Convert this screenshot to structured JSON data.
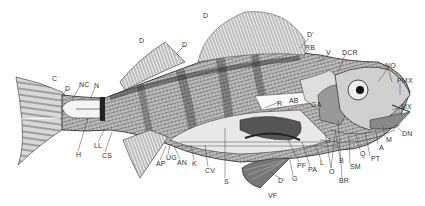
{
  "figure": {
    "caption_visible": "",
    "colors": {
      "ink": "#2a2a2a",
      "shade": "#555555",
      "paper": "#ffffff",
      "light": "#cfcfcf"
    }
  },
  "labels": [
    {
      "id": "D_top",
      "text": "D",
      "x": 203,
      "y": 12
    },
    {
      "id": "D_first1",
      "text": "D",
      "x": 139,
      "y": 37
    },
    {
      "id": "D_first2",
      "text": "D",
      "x": 182,
      "y": 41
    },
    {
      "id": "D_prime_top",
      "text": "D'",
      "x": 307,
      "y": 33
    },
    {
      "id": "RB",
      "text": "RB",
      "x": 306,
      "y": 45
    },
    {
      "id": "V",
      "text": "V",
      "x": 326,
      "y": 50
    },
    {
      "id": "DCR",
      "text": "DCR",
      "x": 342,
      "y": 50
    },
    {
      "id": "NO",
      "text": "NO",
      "x": 385,
      "y": 63
    },
    {
      "id": "PMX",
      "text": "PMX",
      "x": 397,
      "y": 78
    },
    {
      "id": "MX",
      "text": "MX",
      "x": 401,
      "y": 104
    },
    {
      "id": "DN",
      "text": "DN",
      "x": 402,
      "y": 131
    },
    {
      "id": "M",
      "text": "M",
      "x": 386,
      "y": 137
    },
    {
      "id": "A",
      "text": "A",
      "x": 380,
      "y": 144
    },
    {
      "id": "PT",
      "text": "PT",
      "x": 371,
      "y": 156
    },
    {
      "id": "Q",
      "text": "Q",
      "x": 360,
      "y": 150
    },
    {
      "id": "SM",
      "text": "SM",
      "x": 350,
      "y": 164
    },
    {
      "id": "BR",
      "text": "BR",
      "x": 340,
      "y": 178
    },
    {
      "id": "B",
      "text": "B",
      "x": 339,
      "y": 158
    },
    {
      "id": "O",
      "text": "O",
      "x": 329,
      "y": 169
    },
    {
      "id": "L",
      "text": "L",
      "x": 320,
      "y": 160
    },
    {
      "id": "PA",
      "text": "PA",
      "x": 308,
      "y": 166
    },
    {
      "id": "PF",
      "text": "PF",
      "x": 297,
      "y": 162
    },
    {
      "id": "G",
      "text": "G",
      "x": 292,
      "y": 176
    },
    {
      "id": "D_prime_bot",
      "text": "D'",
      "x": 278,
      "y": 178
    },
    {
      "id": "VF",
      "text": "VF",
      "x": 268,
      "y": 193
    },
    {
      "id": "S",
      "text": "S",
      "x": 224,
      "y": 179
    },
    {
      "id": "CV",
      "text": "CV",
      "x": 206,
      "y": 168
    },
    {
      "id": "K",
      "text": "K",
      "x": 192,
      "y": 161
    },
    {
      "id": "AN",
      "text": "AN",
      "x": 177,
      "y": 160
    },
    {
      "id": "UG",
      "text": "UG",
      "x": 166,
      "y": 155
    },
    {
      "id": "AP",
      "text": "AP",
      "x": 157,
      "y": 161
    },
    {
      "id": "CS",
      "text": "CS",
      "x": 103,
      "y": 153
    },
    {
      "id": "LL",
      "text": "LL",
      "x": 95,
      "y": 143
    },
    {
      "id": "H",
      "text": "H",
      "x": 76,
      "y": 152
    },
    {
      "id": "C",
      "text": "C",
      "x": 52,
      "y": 76
    },
    {
      "id": "D_tail",
      "text": "D",
      "x": 65,
      "y": 86
    },
    {
      "id": "NC",
      "text": "NC",
      "x": 79,
      "y": 82
    },
    {
      "id": "N",
      "text": "N",
      "x": 94,
      "y": 83
    },
    {
      "id": "R",
      "text": "R",
      "x": 277,
      "y": 101
    },
    {
      "id": "AB",
      "text": "AB",
      "x": 289,
      "y": 97
    },
    {
      "id": "GA",
      "text": "GA",
      "x": 311,
      "y": 102
    }
  ]
}
